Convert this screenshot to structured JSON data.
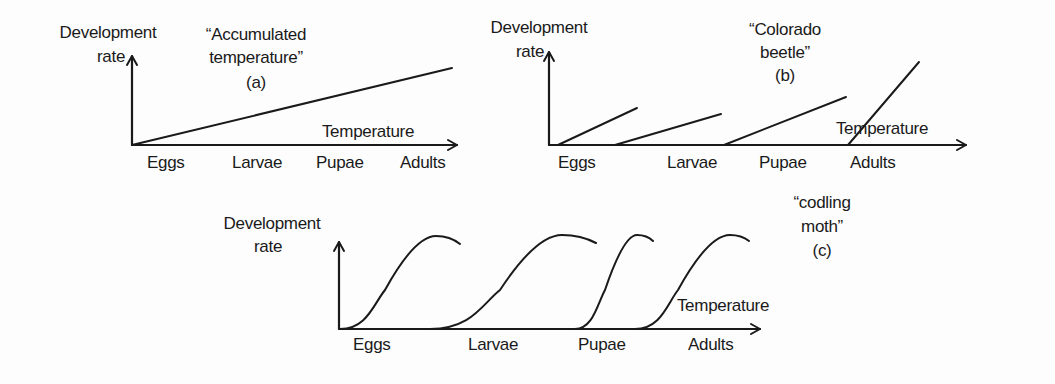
{
  "colors": {
    "ink": "#1a1a1a",
    "background": "#fdfdfd"
  },
  "panels": [
    {
      "id": "a",
      "title_lines": [
        "“Accumulated",
        "temperature”",
        "(a)"
      ],
      "title_pos": [
        {
          "x": 256,
          "y": 40
        },
        {
          "x": 256,
          "y": 63
        },
        {
          "x": 256,
          "y": 88
        }
      ],
      "ylabel_lines": [
        "Development",
        "rate"
      ],
      "ylabel_pos": [
        {
          "x": 108,
          "y": 38
        },
        {
          "x": 111,
          "y": 62
        }
      ],
      "xlabel": "Temperature",
      "xlabel_pos": {
        "x": 368,
        "y": 137
      },
      "axis": {
        "x0": 132,
        "y0": 145,
        "ytop": 56,
        "xend": 457
      },
      "stages": [
        "Eggs",
        "Larvae",
        "Pupae",
        "Adults"
      ],
      "stage_x": [
        147,
        232,
        316,
        400
      ],
      "stage_y": 168,
      "shape": "single-line",
      "lines": [
        {
          "x1": 132,
          "y1": 145,
          "x2": 452,
          "y2": 68
        }
      ]
    },
    {
      "id": "b",
      "title_lines": [
        "“Colorado",
        "beetle”",
        "(b)"
      ],
      "title_pos": [
        {
          "x": 785,
          "y": 35
        },
        {
          "x": 785,
          "y": 58
        },
        {
          "x": 785,
          "y": 81
        }
      ],
      "ylabel_lines": [
        "Development",
        "rate"
      ],
      "ylabel_pos": [
        {
          "x": 539,
          "y": 33
        },
        {
          "x": 530,
          "y": 57
        }
      ],
      "xlabel": "Temperature",
      "xlabel_pos": {
        "x": 882,
        "y": 134
      },
      "axis": {
        "x0": 549,
        "y0": 145,
        "ytop": 52,
        "xend": 966
      },
      "stages": [
        "Eggs",
        "Larvae",
        "Pupae",
        "Adults"
      ],
      "stage_x": [
        558,
        667,
        759,
        850
      ],
      "stage_y": 168,
      "shape": "linear-segments",
      "lines": [
        {
          "x1": 558,
          "y1": 145,
          "x2": 637,
          "y2": 108
        },
        {
          "x1": 615,
          "y1": 145,
          "x2": 721,
          "y2": 114
        },
        {
          "x1": 724,
          "y1": 145,
          "x2": 846,
          "y2": 97
        },
        {
          "x1": 848,
          "y1": 145,
          "x2": 919,
          "y2": 62
        }
      ]
    },
    {
      "id": "c",
      "title_lines": [
        "“codling",
        "moth”",
        "(c)"
      ],
      "title_pos": [
        {
          "x": 822,
          "y": 208
        },
        {
          "x": 822,
          "y": 232
        },
        {
          "x": 822,
          "y": 256
        }
      ],
      "ylabel_lines": [
        "Development",
        "rate"
      ],
      "ylabel_pos": [
        {
          "x": 272,
          "y": 229
        },
        {
          "x": 268,
          "y": 252
        }
      ],
      "xlabel": "Temperature",
      "xlabel_pos": {
        "x": 723,
        "y": 311
      },
      "axis": {
        "x0": 339,
        "y0": 329,
        "ytop": 242,
        "xend": 760
      },
      "stages": [
        "Eggs",
        "Larvae",
        "Pupae",
        "Adults"
      ],
      "stage_x": [
        353,
        468,
        578,
        688
      ],
      "stage_y": 350,
      "shape": "sigmoid-curves",
      "curves": [
        {
          "start": {
            "x": 340,
            "y": 329
          },
          "rise_mid": {
            "x": 385,
            "y": 290
          },
          "peak": {
            "x": 436,
            "y": 236
          },
          "end": {
            "x": 460,
            "y": 244
          }
        },
        {
          "start": {
            "x": 430,
            "y": 329
          },
          "rise_mid": {
            "x": 500,
            "y": 290
          },
          "peak": {
            "x": 562,
            "y": 235
          },
          "end": {
            "x": 596,
            "y": 243
          }
        },
        {
          "start": {
            "x": 575,
            "y": 329
          },
          "rise_mid": {
            "x": 605,
            "y": 290
          },
          "peak": {
            "x": 637,
            "y": 235
          },
          "end": {
            "x": 653,
            "y": 241
          }
        },
        {
          "start": {
            "x": 635,
            "y": 329
          },
          "rise_mid": {
            "x": 678,
            "y": 290
          },
          "peak": {
            "x": 730,
            "y": 235
          },
          "end": {
            "x": 749,
            "y": 241
          }
        }
      ]
    }
  ]
}
